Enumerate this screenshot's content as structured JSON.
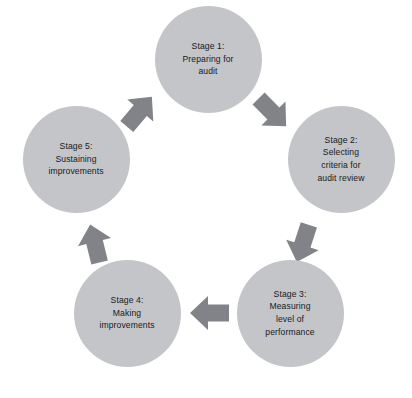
{
  "diagram": {
    "type": "cycle",
    "direction": "clockwise",
    "background_color": "#ffffff",
    "node_color": "#c3c5c8",
    "arrow_color": "#818389",
    "text_color": "#1a1a1a",
    "stages": [
      {
        "id": "stage-1",
        "label": "Stage 1:\nPreparing for\naudit",
        "cx": 208,
        "cy": 59
      },
      {
        "id": "stage-2",
        "label": "Stage 2:\nSelecting\ncriteria for\naudit review",
        "cx": 341,
        "cy": 159
      },
      {
        "id": "stage-3",
        "label": "Stage 3:\nMeasuring\nlevel of\nperformance",
        "cx": 290,
        "cy": 313
      },
      {
        "id": "stage-4",
        "label": "Stage 4:\nMaking\nimprovements",
        "cx": 127,
        "cy": 313
      },
      {
        "id": "stage-5",
        "label": "Stage 5:\nSustaining\nimprovements",
        "cx": 76,
        "cy": 159
      }
    ],
    "arrows": [
      {
        "id": "arrow-stage1-to-stage2",
        "from": "stage-1",
        "to": "stage-2",
        "x": 272,
        "y": 112,
        "rotation": 135
      },
      {
        "id": "arrow-stage2-to-stage3",
        "from": "stage-2",
        "to": "stage-3",
        "x": 303,
        "y": 243,
        "rotation": 198
      },
      {
        "id": "arrow-stage3-to-stage4",
        "from": "stage-3",
        "to": "stage-4",
        "x": 210,
        "y": 313,
        "rotation": 270
      },
      {
        "id": "arrow-stage4-to-stage5",
        "from": "stage-4",
        "to": "stage-5",
        "x": 95,
        "y": 244,
        "rotation": 346
      },
      {
        "id": "arrow-stage5-to-stage1",
        "from": "stage-5",
        "to": "stage-1",
        "x": 139,
        "y": 112,
        "rotation": 40
      }
    ]
  }
}
